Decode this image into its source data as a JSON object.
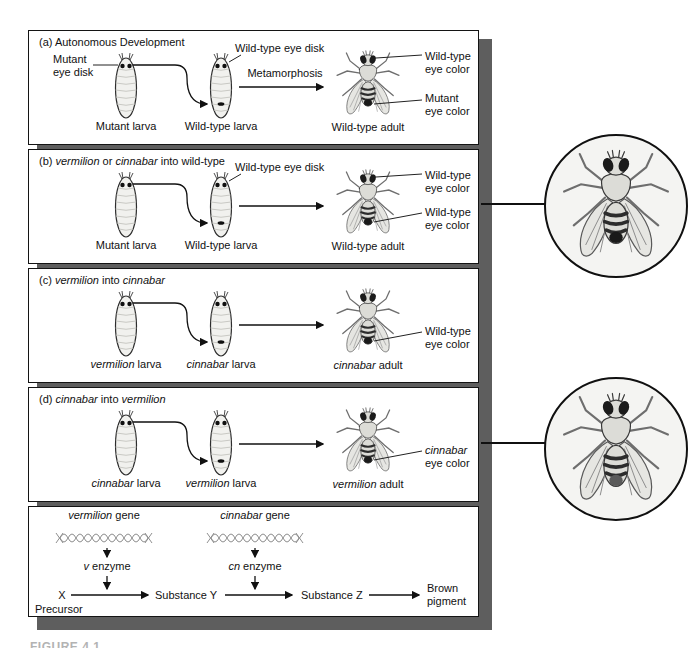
{
  "figure_caption": "FIGURE 4.1",
  "colors": {
    "shadow": "#5e5e5e",
    "border": "#141414",
    "background": "#ffffff",
    "wildtype_eye_spot": "#1a1a1a",
    "cinnabar_eye_spot": "#5a5a5a"
  },
  "panels": {
    "a": {
      "title": "(a) Autonomous Development",
      "mutant_disk": [
        "Mutant",
        "eye disk"
      ],
      "wildtype_disk": "Wild-type eye disk",
      "metamorphosis": "Metamorphosis",
      "larva1": "Mutant larva",
      "larva2": "Wild-type larva",
      "adult": "Wild-type adult",
      "eye_top": [
        "Wild-type",
        "eye color"
      ],
      "eye_bottom": [
        "Mutant",
        "eye color"
      ]
    },
    "b": {
      "title": [
        "(b) ",
        "vermilion",
        " or ",
        "cinnabar",
        " into wild-type"
      ],
      "wildtype_disk": "Wild-type eye disk",
      "larva1": "Mutant larva",
      "larva2": "Wild-type larva",
      "adult": "Wild-type adult",
      "eye_top": [
        "Wild-type",
        "eye color"
      ],
      "eye_bottom": [
        "Wild-type",
        "eye color"
      ]
    },
    "c": {
      "title": [
        "(c) ",
        "vermilion",
        " into ",
        "cinnabar",
        ""
      ],
      "larva1": [
        "vermilion",
        " larva"
      ],
      "larva2": [
        "cinnabar",
        " larva"
      ],
      "adult": [
        "cinnabar",
        " adult"
      ],
      "eye_bottom": [
        "Wild-type",
        "eye color"
      ]
    },
    "d": {
      "title": [
        "(d) ",
        "cinnabar",
        " into ",
        "vermilion",
        ""
      ],
      "larva1": [
        "cinnabar",
        " larva"
      ],
      "larva2": [
        "vermilion",
        " larva"
      ],
      "adult": [
        "vermilion",
        " adult"
      ],
      "eye_bottom": [
        "cinnabar",
        "eye color"
      ]
    },
    "e": {
      "gene1": [
        "vermilion",
        " gene"
      ],
      "gene2": [
        "cinnabar",
        " gene"
      ],
      "enzyme1": [
        "v",
        " enzyme"
      ],
      "enzyme2": [
        "cn",
        " enzyme"
      ],
      "precursor_symbol": "X",
      "precursor": "Precursor",
      "substance_y": "Substance Y",
      "substance_z": "Substance Z",
      "product": [
        "Brown",
        "pigment"
      ]
    }
  },
  "insets": {
    "top": {
      "icon": "fly-dorsal-photo-wildtype-eye"
    },
    "bottom": {
      "icon": "fly-dorsal-photo-cinnabar-eye"
    }
  }
}
